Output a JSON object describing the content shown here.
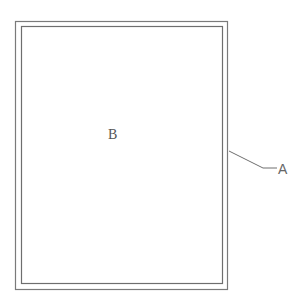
{
  "diagram": {
    "labels": {
      "inner": "B",
      "outer": "A"
    },
    "colors": {
      "stroke": "#7a7a7a",
      "text": "#555555",
      "background": "#ffffff"
    }
  }
}
